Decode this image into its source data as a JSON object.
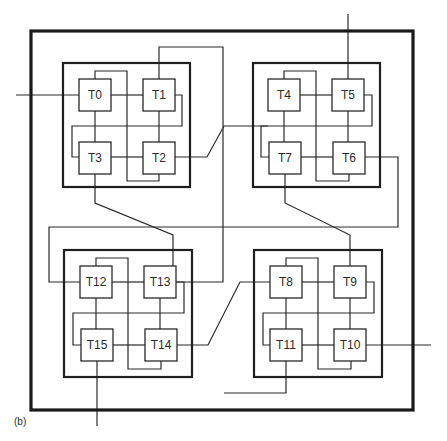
{
  "caption": "(b)",
  "colors": {
    "line": "#2a2a2a",
    "background": "#ffffff"
  },
  "outer_box": {
    "x": 31,
    "y": 31,
    "w": 382,
    "h": 379
  },
  "clusters": [
    {
      "id": "top-left",
      "x": 63,
      "y": 63,
      "w": 127,
      "h": 124
    },
    {
      "id": "top-right",
      "x": 253,
      "y": 63,
      "w": 127,
      "h": 124
    },
    {
      "id": "bottom-left",
      "x": 64,
      "y": 250,
      "w": 128,
      "h": 127
    },
    {
      "id": "bottom-right",
      "x": 254,
      "y": 250,
      "w": 128,
      "h": 127
    }
  ],
  "tiles": [
    {
      "label": "T0",
      "x": 79,
      "y": 79
    },
    {
      "label": "T1",
      "x": 143,
      "y": 79
    },
    {
      "label": "T2",
      "x": 143,
      "y": 142
    },
    {
      "label": "T3",
      "x": 79,
      "y": 142
    },
    {
      "label": "T4",
      "x": 268,
      "y": 79
    },
    {
      "label": "T5",
      "x": 332,
      "y": 79
    },
    {
      "label": "T6",
      "x": 333,
      "y": 142
    },
    {
      "label": "T7",
      "x": 269,
      "y": 142
    },
    {
      "label": "T8",
      "x": 270,
      "y": 266
    },
    {
      "label": "T9",
      "x": 334,
      "y": 266
    },
    {
      "label": "T10",
      "x": 334,
      "y": 329
    },
    {
      "label": "T11",
      "x": 270,
      "y": 329
    },
    {
      "label": "T12",
      "x": 80,
      "y": 266
    },
    {
      "label": "T13",
      "x": 144,
      "y": 266
    },
    {
      "label": "T14",
      "x": 145,
      "y": 329
    },
    {
      "label": "T15",
      "x": 81,
      "y": 329
    }
  ],
  "tile_size": 32
}
